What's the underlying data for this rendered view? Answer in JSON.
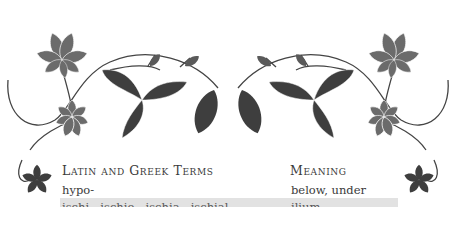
{
  "table": {
    "headers": {
      "term": "Latin and Greek Terms",
      "meaning": "Meaning"
    },
    "rows": [
      {
        "term": "hypo-",
        "meaning": "below, under",
        "shaded": false
      },
      {
        "term": "ischi-, ischio-, ischia-, ischial",
        "meaning": "ilium",
        "shaded": true
      }
    ]
  },
  "decoration": {
    "description": "horse-chestnut leaf vine border",
    "leaf_color_light": "#6b6b6b",
    "leaf_color_dark": "#3e3e3e",
    "stem_color": "#444444"
  }
}
